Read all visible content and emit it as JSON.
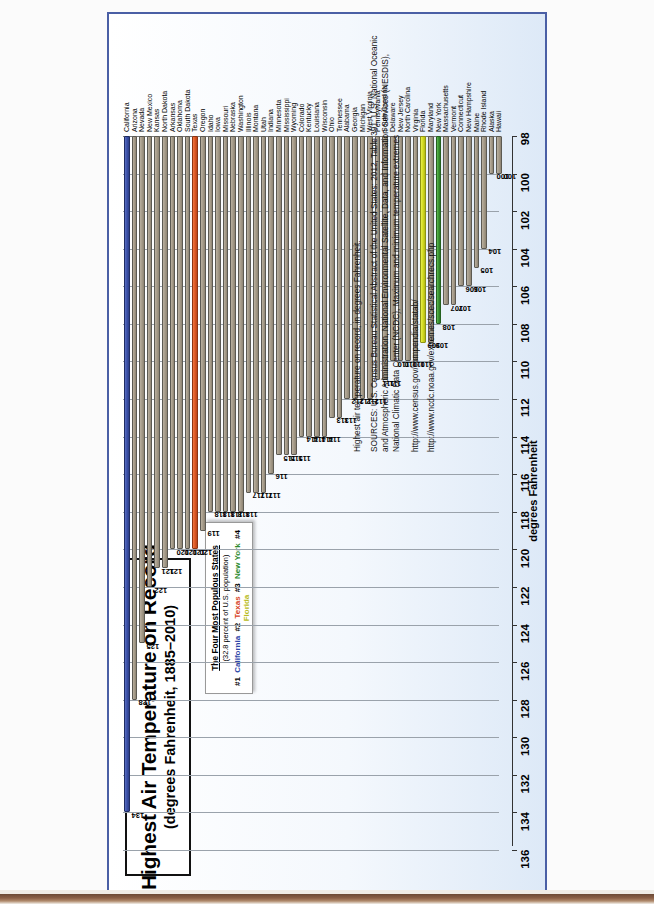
{
  "chart_data": {
    "type": "bar",
    "title": "Highest Air Temperature on Record",
    "subtitle": "(degrees Fahrenheit, 1885–2010)",
    "orientation": "horizontal",
    "xlabel": "",
    "ylabel": "degrees Fahrenheit",
    "ylim": [
      98,
      136
    ],
    "tick_step": 2,
    "ticks": [
      "136",
      "134",
      "132",
      "130",
      "128",
      "126",
      "124",
      "122",
      "120",
      "118",
      "116",
      "114",
      "112",
      "110",
      "108",
      "106",
      "104",
      "102",
      "100",
      "98"
    ],
    "grid": true,
    "legend_position": "top-inside",
    "categories": [
      "California",
      "Arizona",
      "Nevada",
      "New Mexico",
      "Kansas",
      "North Dakota",
      "Arkansas",
      "Oklahoma",
      "South Dakota",
      "Texas",
      "Oregon",
      "Idaho",
      "Iowa",
      "Missouri",
      "Nebraska",
      "Washington",
      "Illinois",
      "Montana",
      "Utah",
      "Indiana",
      "Minnesota",
      "Mississippi",
      "Wyoming",
      "Colorado",
      "Kentucky",
      "Louisiana",
      "Wisconsin",
      "Ohio",
      "Tennessee",
      "Alabama",
      "Georgia",
      "Michigan",
      "West Virginia",
      "Pennsylvania",
      "South Carolina",
      "Delaware",
      "New Jersey",
      "North Carolina",
      "Virginia",
      "Florida",
      "Maryland",
      "New York",
      "Massachusetts",
      "Vermont",
      "Connecticut",
      "New Hampshire",
      "Maine",
      "Rhode Island",
      "Alaska",
      "Hawaii"
    ],
    "values": [
      134,
      128,
      125,
      122,
      121,
      121,
      120,
      120,
      120,
      120,
      119,
      118,
      118,
      118,
      118,
      118,
      117,
      117,
      117,
      116,
      115,
      115,
      115,
      114,
      114,
      114,
      114,
      113,
      113,
      112,
      112,
      112,
      112,
      111,
      111,
      110,
      110,
      110,
      110,
      109,
      109,
      108,
      107,
      107,
      106,
      106,
      105,
      104,
      100,
      100
    ],
    "highlight": {
      "California": "#3d52ab",
      "Texas": "#e15a24",
      "New York": "#3d9b33",
      "Florida": "#d6dd22"
    },
    "bar_color_default": "#a79d8b"
  },
  "legend": {
    "heading": "The Four Most Populous States",
    "subheading": "(32.8 percent of U.S. population)",
    "entries": [
      {
        "rank": "#1",
        "state": "California",
        "color": "#2f47a8"
      },
      {
        "rank": "#2",
        "state": "Texas",
        "color": "#d7451f"
      },
      {
        "rank": "#3",
        "state": "New York",
        "color": "#2e8b2e"
      },
      {
        "rank": "#4",
        "state": "Florida",
        "color": "#b9bc22"
      }
    ]
  },
  "footer": {
    "note": "Highest air temperature on record, in degrees Fahrenheit.",
    "sources": "SOURCES: U.S. Census Bureau Statistical Abstract of the United States: 2012, Table 391; U.S. National Oceanic and Atmospheric Administration, National Environmental Satellite, Data, and Information Services (NESDIS), National Climatic Data Center (NCDC), Maximum and minimum temperature extremes",
    "url1": "http://www.census.gov/compendia/statab/",
    "url2": "http://www.ncdc.noaa.gov/extremes/scec/searchrecs.php"
  }
}
